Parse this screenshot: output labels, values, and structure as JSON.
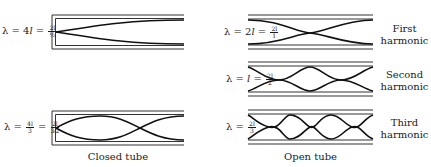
{
  "closed_tube": {
    "caption": "Closed tube",
    "modes": [
      {
        "lambda_prefix": "λ = 4",
        "lambda_l": "l",
        "eq": "=",
        "frac_num": "2l",
        "frac_den": "½"
      },
      {
        "lambda_prefix": "λ =",
        "frac1_num": "4l",
        "frac1_den": "3",
        "eq": "=",
        "frac2_num": "2l",
        "frac2_den": "3⁄2"
      }
    ]
  },
  "open_tube": {
    "caption": "Open tube",
    "modes": [
      {
        "lambda_prefix": "λ = 2",
        "lambda_l": "l",
        "eq": "=",
        "frac_num": "2l",
        "frac_den": "1",
        "harmonic_line1": "First",
        "harmonic_line2": "harmonic"
      },
      {
        "lambda_prefix": "λ =",
        "lambda_l": "l",
        "eq": "=",
        "frac_num": "2l",
        "frac_den": "2",
        "harmonic_line1": "Second",
        "harmonic_line2": "harmonic"
      },
      {
        "lambda_prefix": "λ =",
        "frac_num": "2l",
        "frac_den": "3",
        "harmonic_line1": "Third",
        "harmonic_line2": "harmonic"
      }
    ]
  },
  "colors": {
    "ink": "#1a1a1a",
    "tube": "#333333",
    "background": "#ffffff"
  }
}
